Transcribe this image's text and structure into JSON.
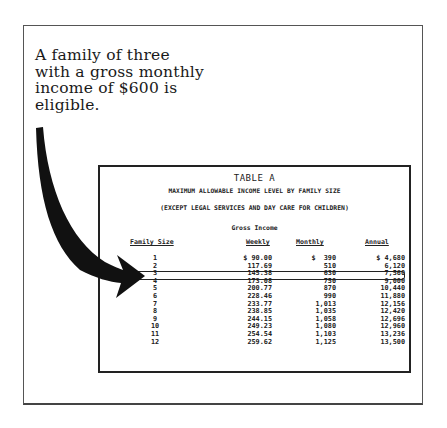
{
  "caption": {
    "lines": [
      "A family of three",
      "with a gross monthly",
      "income of $600 is",
      "eligible."
    ]
  },
  "icons": {
    "arrow": "curved-arrow-pointing-right"
  },
  "table": {
    "title": "TABLE A",
    "subtitle": "MAXIMUM ALLOWABLE INCOME LEVEL BY FAMILY SIZE",
    "exception": "(EXCEPT LEGAL SERVICES AND DAY CARE FOR CHILDREN)",
    "group_header": "Gross Income",
    "columns": [
      "Family Size",
      "Weekly",
      "Monthly",
      "Annual"
    ],
    "highlighted_row": 3,
    "rows": [
      {
        "size": "1",
        "weekly": "$ 90.00",
        "monthly": "$  390",
        "annual": "$ 4,680"
      },
      {
        "size": "2",
        "weekly": "117.69",
        "monthly": "510",
        "annual": "6,120"
      },
      {
        "size": "3",
        "weekly": "145.38",
        "monthly": "630",
        "annual": "7,560"
      },
      {
        "size": "4",
        "weekly": "173.08",
        "monthly": "750",
        "annual": "9,000"
      },
      {
        "size": "5",
        "weekly": "200.77",
        "monthly": "870",
        "annual": "10,440"
      },
      {
        "size": "6",
        "weekly": "228.46",
        "monthly": "990",
        "annual": "11,880"
      },
      {
        "size": "7",
        "weekly": "233.77",
        "monthly": "1,013",
        "annual": "12,156"
      },
      {
        "size": "8",
        "weekly": "238.85",
        "monthly": "1,035",
        "annual": "12,420"
      },
      {
        "size": "9",
        "weekly": "244.15",
        "monthly": "1,058",
        "annual": "12,696"
      },
      {
        "size": "10",
        "weekly": "249.23",
        "monthly": "1,080",
        "annual": "12,960"
      },
      {
        "size": "11",
        "weekly": "254.54",
        "monthly": "1,103",
        "annual": "13,236"
      },
      {
        "size": "12",
        "weekly": "259.62",
        "monthly": "1,125",
        "annual": "13,500"
      }
    ]
  }
}
